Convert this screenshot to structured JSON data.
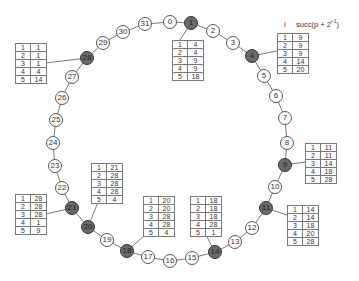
{
  "diagram": {
    "type": "chord-ring",
    "legend": {
      "col_i": "i",
      "col_succ": "succ(p + 2",
      "col_succ_exp": "i-1",
      "col_succ_close": ")"
    },
    "nodes": [
      {
        "id": "0",
        "x": 170,
        "y": 22,
        "active": false
      },
      {
        "id": "1",
        "x": 191,
        "y": 23,
        "active": true
      },
      {
        "id": "2",
        "x": 213,
        "y": 31,
        "active": false
      },
      {
        "id": "3",
        "x": 233,
        "y": 43,
        "active": false
      },
      {
        "id": "4",
        "x": 252,
        "y": 56,
        "active": true
      },
      {
        "id": "5",
        "x": 264,
        "y": 76,
        "active": false
      },
      {
        "id": "6",
        "x": 276,
        "y": 96,
        "active": false
      },
      {
        "id": "7",
        "x": 285,
        "y": 118,
        "active": false
      },
      {
        "id": "8",
        "x": 287,
        "y": 143,
        "active": false
      },
      {
        "id": "9",
        "x": 285,
        "y": 165,
        "active": true
      },
      {
        "id": "10",
        "x": 275,
        "y": 187,
        "active": false
      },
      {
        "id": "11",
        "x": 266,
        "y": 208,
        "active": true
      },
      {
        "id": "12",
        "x": 252,
        "y": 228,
        "active": false
      },
      {
        "id": "13",
        "x": 235,
        "y": 242,
        "active": false
      },
      {
        "id": "14",
        "x": 215,
        "y": 252,
        "active": true
      },
      {
        "id": "15",
        "x": 192,
        "y": 258,
        "active": false
      },
      {
        "id": "16",
        "x": 170,
        "y": 261,
        "active": false
      },
      {
        "id": "17",
        "x": 148,
        "y": 257,
        "active": false
      },
      {
        "id": "18",
        "x": 127,
        "y": 251,
        "active": true
      },
      {
        "id": "19",
        "x": 107,
        "y": 240,
        "active": false
      },
      {
        "id": "20",
        "x": 88,
        "y": 227,
        "active": true
      },
      {
        "id": "21",
        "x": 72,
        "y": 208,
        "active": true
      },
      {
        "id": "22",
        "x": 62,
        "y": 188,
        "active": false
      },
      {
        "id": "23",
        "x": 55,
        "y": 166,
        "active": false
      },
      {
        "id": "24",
        "x": 53,
        "y": 143,
        "active": false
      },
      {
        "id": "25",
        "x": 56,
        "y": 120,
        "active": false
      },
      {
        "id": "26",
        "x": 62,
        "y": 98,
        "active": false
      },
      {
        "id": "27",
        "x": 72,
        "y": 77,
        "active": false
      },
      {
        "id": "28",
        "x": 87,
        "y": 58,
        "active": true
      },
      {
        "id": "29",
        "x": 103,
        "y": 43,
        "active": false
      },
      {
        "id": "30",
        "x": 123,
        "y": 32,
        "active": false
      },
      {
        "id": "31",
        "x": 145,
        "y": 24,
        "active": false
      }
    ],
    "finger_tables": [
      {
        "node": "1",
        "x": 172,
        "y": 40,
        "lx": 180,
        "ly": 40,
        "rows": [
          [
            "1",
            "4"
          ],
          [
            "2",
            "4"
          ],
          [
            "3",
            "9"
          ],
          [
            "4",
            "9"
          ],
          [
            "5",
            "18"
          ]
        ]
      },
      {
        "node": "4",
        "x": 277,
        "y": 33,
        "lx": 277,
        "ly": 51,
        "rows": [
          [
            "1",
            "9"
          ],
          [
            "2",
            "9"
          ],
          [
            "3",
            "9"
          ],
          [
            "4",
            "14"
          ],
          [
            "5",
            "20"
          ]
        ]
      },
      {
        "node": "9",
        "x": 305,
        "y": 143,
        "lx": 305,
        "ly": 162,
        "rows": [
          [
            "1",
            "11"
          ],
          [
            "2",
            "11"
          ],
          [
            "3",
            "14"
          ],
          [
            "4",
            "18"
          ],
          [
            "5",
            "28"
          ]
        ]
      },
      {
        "node": "11",
        "x": 287,
        "y": 205,
        "lx": 287,
        "ly": 215,
        "rows": [
          [
            "1",
            "14"
          ],
          [
            "2",
            "14"
          ],
          [
            "3",
            "18"
          ],
          [
            "4",
            "20"
          ],
          [
            "5",
            "28"
          ]
        ]
      },
      {
        "node": "14",
        "x": 190,
        "y": 196,
        "lx": 206,
        "ly": 235,
        "rows": [
          [
            "1",
            "18"
          ],
          [
            "2",
            "18"
          ],
          [
            "3",
            "18"
          ],
          [
            "4",
            "28"
          ],
          [
            "5",
            "1"
          ]
        ]
      },
      {
        "node": "18",
        "x": 143,
        "y": 196,
        "lx": 145,
        "ly": 235,
        "rows": [
          [
            "1",
            "20"
          ],
          [
            "2",
            "20"
          ],
          [
            "3",
            "28"
          ],
          [
            "4",
            "28"
          ],
          [
            "5",
            "4"
          ]
        ]
      },
      {
        "node": "20",
        "x": 91,
        "y": 163,
        "lx": 98,
        "ly": 202,
        "rows": [
          [
            "1",
            "21"
          ],
          [
            "2",
            "28"
          ],
          [
            "3",
            "28"
          ],
          [
            "4",
            "28"
          ],
          [
            "5",
            "4"
          ]
        ]
      },
      {
        "node": "21",
        "x": 15,
        "y": 194,
        "lx": 46,
        "ly": 214,
        "rows": [
          [
            "1",
            "28"
          ],
          [
            "2",
            "28"
          ],
          [
            "3",
            "28"
          ],
          [
            "4",
            "1"
          ],
          [
            "5",
            "9"
          ]
        ]
      },
      {
        "node": "28",
        "x": 15,
        "y": 43,
        "lx": 46,
        "ly": 63,
        "rows": [
          [
            "1",
            "1"
          ],
          [
            "2",
            "1"
          ],
          [
            "3",
            "1"
          ],
          [
            "4",
            "4"
          ],
          [
            "5",
            "14"
          ]
        ]
      }
    ]
  }
}
